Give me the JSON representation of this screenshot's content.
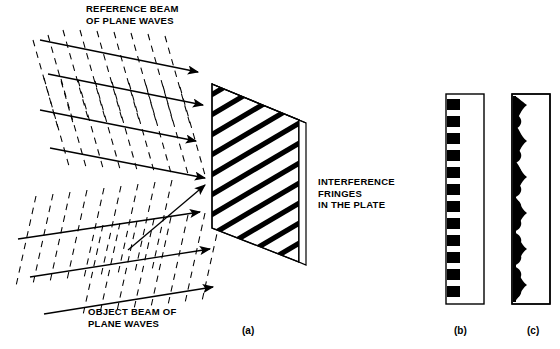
{
  "figure": {
    "background_color": "#ffffff",
    "ink_color": "#000000",
    "width": 560,
    "height": 349
  },
  "labels": {
    "reference_beam": "REFERENCE BEAM\nOF PLANE WAVES",
    "object_beam": "OBJECT BEAM OF\nPLANE WAVES",
    "interference_fringes": "INTERFERENCE\nFRINGES\nIN THE PLATE"
  },
  "captions": {
    "a": "(a)",
    "b": "(b)",
    "c": "(c)"
  },
  "panels": {
    "a": {
      "name": "recording-plate",
      "caption": "(a)",
      "description": "Tilted rectangular photographic plate shown in perspective with diagonal interference fringes across its face",
      "fringe_count": 10,
      "fringe_color": "#000000",
      "plate_face_color": "#ffffff",
      "plate_edge_color": "#ffffff"
    },
    "b": {
      "name": "binary-fringe-profile",
      "caption": "(b)",
      "description": "Narrow vertical strip with discrete square black blocks along the left edge representing a high-contrast binary fringe pattern",
      "block_count": 12,
      "block_color": "#000000",
      "strip_border_color": "#000000"
    },
    "c": {
      "name": "sinusoidal-fringe-profile",
      "caption": "(c)",
      "description": "Narrow vertical strip with a continuous black band whose right edge is scalloped in a sinusoidal profile",
      "cycle_count": 12,
      "band_color": "#000000",
      "strip_border_color": "#000000"
    }
  },
  "beams": {
    "reference": {
      "name": "reference-beam",
      "ray_count": 4,
      "ray_style": "solid-with-arrowhead",
      "wavefront_style": "dashed",
      "direction": "down-right",
      "label": "REFERENCE BEAM OF PLANE WAVES"
    },
    "object": {
      "name": "object-beam",
      "ray_count": 3,
      "ray_style": "solid-with-arrowhead",
      "wavefront_style": "dashed",
      "direction": "up-right",
      "label": "OBJECT BEAM OF PLANE WAVES"
    }
  }
}
